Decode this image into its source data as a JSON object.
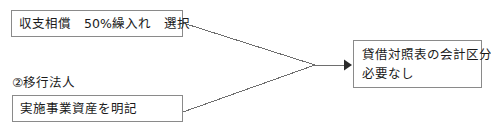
{
  "diagram": {
    "background_color": "#ffffff",
    "border_color": "#8a8a8a",
    "text_color": "#1a1a1a",
    "nodes": [
      {
        "id": "offset_selection",
        "text": "収支相償　50%繰入れ　選択",
        "x": 11,
        "y": 10,
        "width": 172,
        "height": 27
      },
      {
        "id": "asset_statement",
        "text": "実施事業資産を明記",
        "x": 12,
        "y": 95,
        "width": 171,
        "height": 27
      },
      {
        "id": "balance_sheet_result",
        "line1": "貸借対照表の会計区分",
        "line2": "必要なし",
        "x": 353,
        "y": 40,
        "width": 129,
        "height": 48
      }
    ],
    "labels": [
      {
        "id": "transition_corporation",
        "text": "②移行法人",
        "x": 12,
        "y": 76
      }
    ],
    "connectors": [
      {
        "id": "offset-to-merge",
        "from": "offset_selection",
        "to": "merge_point",
        "points": "183,23 315,65"
      },
      {
        "id": "asset-to-merge",
        "from": "asset_statement",
        "to": "merge_point",
        "points": "183,112 315,65"
      },
      {
        "id": "merge-to-result",
        "from": "merge_point",
        "to": "balance_sheet_result",
        "points": "315,65 345,65",
        "arrowhead": "triangle-right",
        "arrow_tip_x": 352,
        "arrow_tip_y": 65
      }
    ]
  }
}
